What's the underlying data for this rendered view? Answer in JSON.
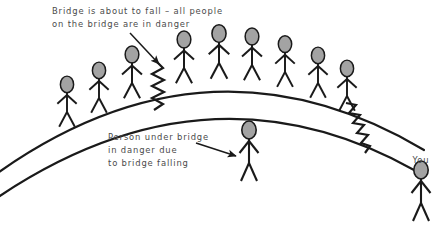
{
  "diagram": {
    "title_visible": false,
    "background_color": "#ffffff",
    "stroke_color": "#1a1a1a",
    "head_fill_color": "#a3a3a3",
    "text_color": "#4a4a4a",
    "annotations": [
      {
        "id": "bridge-warning",
        "lines": [
          "Bridge is about to fall – all people",
          "on the bridge are in danger"
        ],
        "x": 52,
        "y": 12,
        "arrow": {
          "from_x": 130,
          "from_y": 33,
          "to_x": 158,
          "to_y": 63
        }
      },
      {
        "id": "person-under-bridge",
        "lines": [
          "Person under bridge",
          "in danger due",
          "to bridge falling"
        ],
        "x": 108,
        "y": 137,
        "arrow": {
          "from_x": 196,
          "from_y": 143,
          "to_x": 232,
          "to_y": 157
        }
      }
    ],
    "labels": [
      {
        "id": "you-label",
        "text": "You",
        "x": 421,
        "y": 160
      }
    ],
    "bridge": {
      "description": "two parallel arcs forming a bridge deck",
      "upper_arc": "M -10 178 Q 205 22 420 150",
      "lower_arc": "M -10 200 Q 205 55 410 168",
      "stroke_width": 2.2
    },
    "cracks": [
      {
        "id": "crack-left",
        "x": 158,
        "y_top": 64,
        "y_bottom": 108,
        "teeth": 9,
        "amplitude": 6,
        "angle": 0
      },
      {
        "id": "crack-right",
        "x": 356,
        "y_top": 104,
        "y_bottom": 152,
        "teeth": 9,
        "amplitude": 6,
        "angle": 28
      }
    ],
    "people_on_bridge": [
      {
        "id": "person-1",
        "x": 67,
        "y": 112
      },
      {
        "id": "person-2",
        "x": 99,
        "y": 98
      },
      {
        "id": "person-3",
        "x": 132,
        "y": 83
      },
      {
        "id": "person-4",
        "x": 183,
        "y": 66
      },
      {
        "id": "person-5",
        "x": 218,
        "y": 62
      },
      {
        "id": "person-6",
        "x": 250,
        "y": 64
      },
      {
        "id": "person-7",
        "x": 284,
        "y": 70
      },
      {
        "id": "person-8",
        "x": 317,
        "y": 82
      },
      {
        "id": "person-9",
        "x": 345,
        "y": 94
      }
    ],
    "person_under_bridge": {
      "id": "person-under",
      "x": 249,
      "y": 133
    },
    "person_you": {
      "id": "person-you",
      "x": 421,
      "y": 172
    },
    "counts": {
      "people_on_bridge": 9,
      "people_under_bridge": 1,
      "observers": 1
    }
  }
}
